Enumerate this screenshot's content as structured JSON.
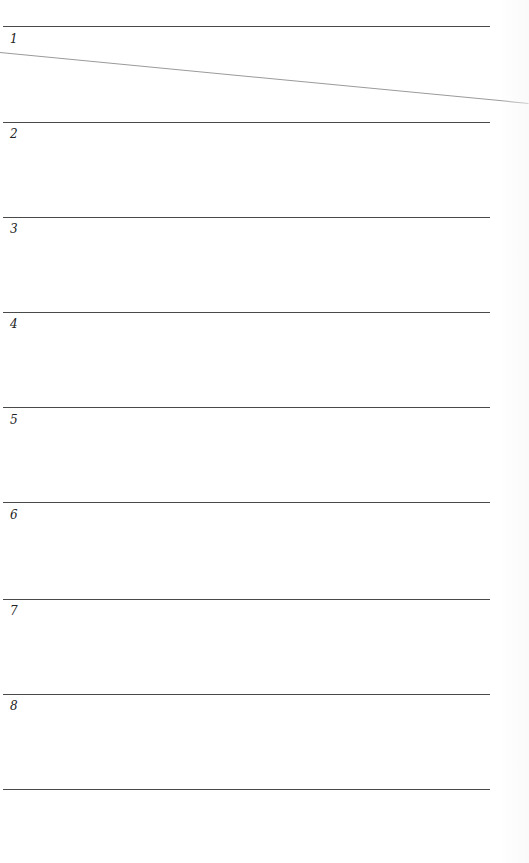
{
  "document": {
    "type": "numbered-blank-list",
    "entries": [
      {
        "number": "1"
      },
      {
        "number": "2"
      },
      {
        "number": "3"
      },
      {
        "number": "4"
      },
      {
        "number": "5"
      },
      {
        "number": "6"
      },
      {
        "number": "7"
      },
      {
        "number": "8"
      }
    ],
    "colors": {
      "rule": "#4a4a4a",
      "stray_line": "#9a9a9a",
      "background": "#ffffff"
    }
  }
}
